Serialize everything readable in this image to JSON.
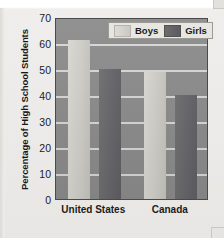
{
  "chart_data": {
    "type": "bar",
    "title": "",
    "xlabel": "",
    "ylabel": "Percentage of High School Students",
    "categories": [
      "United States",
      "Canada"
    ],
    "series": [
      {
        "name": "Boys",
        "values": [
          61,
          49
        ],
        "color": "#cfcec8"
      },
      {
        "name": "Girls",
        "values": [
          50,
          40
        ],
        "color": "#66666a"
      }
    ],
    "ylim": [
      0,
      70
    ],
    "yticks": [
      0,
      10,
      20,
      30,
      40,
      50,
      60,
      70
    ],
    "ytick_labels": [
      "0",
      "10",
      "20",
      "30",
      "40",
      "50",
      "60",
      "70"
    ],
    "grid": true,
    "legend_position": "top-right",
    "legend_entries": [
      "Boys",
      "Girls"
    ],
    "plot_background": "#8b8b8b",
    "gridline_color": "#dcdcda"
  },
  "legend": {
    "boys_label": "Boys",
    "girls_label": "Girls"
  },
  "axes": {
    "y_title": "Percentage of High School Students",
    "x_categories": [
      "United States",
      "Canada"
    ]
  }
}
